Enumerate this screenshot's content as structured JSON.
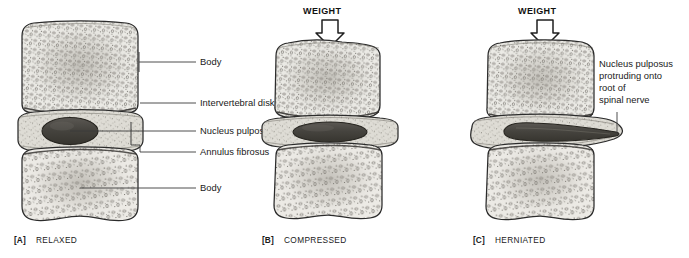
{
  "figure": {
    "background_color": "#ffffff",
    "ink_color": "#2b2b2b",
    "bone_fill": "#e8e7e2",
    "disk_fill": "#d8d7d1",
    "nucleus_fill": "#4a4843"
  },
  "panels": [
    {
      "id": "A",
      "tag": "[A]",
      "caption": "RELAXED",
      "has_weight_arrow": false,
      "weight_label": "",
      "labels": [
        {
          "key": "body_upper",
          "text": "Body"
        },
        {
          "key": "intervertebral",
          "text": "Intervertebral disk"
        },
        {
          "key": "nucleus",
          "text": "Nucleus pulposus"
        },
        {
          "key": "annulus",
          "text": "Annulus fibrosus"
        },
        {
          "key": "body_lower",
          "text": "Body"
        }
      ]
    },
    {
      "id": "B",
      "tag": "[B]",
      "caption": "COMPRESSED",
      "has_weight_arrow": true,
      "weight_label": "WEIGHT",
      "labels": []
    },
    {
      "id": "C",
      "tag": "[C]",
      "caption": "HERNIATED",
      "has_weight_arrow": true,
      "weight_label": "WEIGHT",
      "labels": [
        {
          "key": "herniation_l1",
          "text": "Nucleus pulposus"
        },
        {
          "key": "herniation_l2",
          "text": "protruding onto"
        },
        {
          "key": "herniation_l3",
          "text": "root of"
        },
        {
          "key": "herniation_l4",
          "text": "spinal nerve"
        }
      ]
    }
  ]
}
